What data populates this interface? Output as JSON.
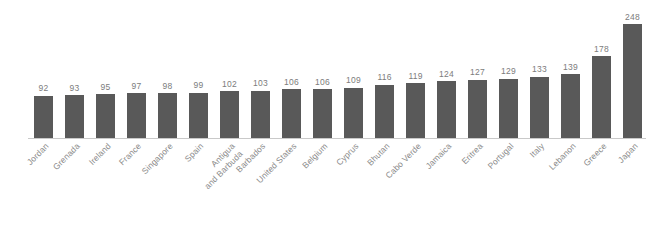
{
  "chart_data": {
    "type": "bar",
    "title": "",
    "subtitle": "",
    "xlabel": "",
    "ylabel": "",
    "ylim": [
      0,
      248
    ],
    "grid": false,
    "legend": "none",
    "orientation": "vertical",
    "sorted": "ascending",
    "bar_color": "#595959",
    "value_label_color": "#7c7c7c",
    "tick_label_color": "#8a8a8a",
    "axis_line_color": "#c9c9c9",
    "background_color": "#ffffff",
    "tick_label_rotation": -45,
    "categories": [
      "Jordan",
      "Grenada",
      "Ireland",
      "France",
      "Singapore",
      "Spain",
      "Antigua and Barbuda",
      "Barbados",
      "United States",
      "Belgium",
      "Cyprus",
      "Bhutan",
      "Cabo Verde",
      "Jamaica",
      "Eritrea",
      "Portugal",
      "Italy",
      "Lebanon",
      "Greece",
      "Japan"
    ],
    "category_lines": [
      [
        "Jordan"
      ],
      [
        "Grenada"
      ],
      [
        "Ireland"
      ],
      [
        "France"
      ],
      [
        "Singapore"
      ],
      [
        "Spain"
      ],
      [
        "Antigua",
        "and Barbuda"
      ],
      [
        "Barbados"
      ],
      [
        "United States"
      ],
      [
        "Belgium"
      ],
      [
        "Cyprus"
      ],
      [
        "Bhutan"
      ],
      [
        "Cabo Verde"
      ],
      [
        "Jamaica"
      ],
      [
        "Eritrea"
      ],
      [
        "Portugal"
      ],
      [
        "Italy"
      ],
      [
        "Lebanon"
      ],
      [
        "Greece"
      ],
      [
        "Japan"
      ]
    ],
    "values": [
      92,
      93,
      95,
      97,
      98,
      99,
      102,
      103,
      106,
      106,
      109,
      116,
      119,
      124,
      127,
      129,
      133,
      139,
      178,
      248
    ]
  }
}
